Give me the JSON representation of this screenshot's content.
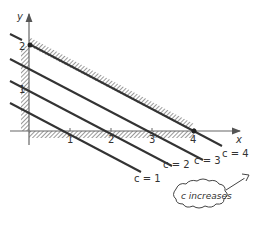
{
  "diagram": {
    "type": "linear-programming-isolines",
    "axes": {
      "x_label": "x",
      "y_label": "y",
      "x_ticks": [
        "1",
        "2",
        "3",
        "4"
      ],
      "y_ticks": [
        "1",
        "2"
      ]
    },
    "constraint": {
      "description": "Feasible region bounded by x >= 0, y >= 0 and line through (0,2) and (4,0); hatched on infeasible side",
      "vertices": [
        [
          0,
          2
        ],
        [
          4,
          0
        ]
      ]
    },
    "isolines": [
      {
        "label": "c = 1"
      },
      {
        "label": "c = 2"
      },
      {
        "label": "c = 3"
      },
      {
        "label": "c = 4"
      }
    ],
    "annotation": {
      "text": "c increases",
      "shape": "cloud-with-arrow"
    },
    "colors": {
      "line": "#333333",
      "axis": "#666666",
      "hatch": "#555555"
    }
  }
}
